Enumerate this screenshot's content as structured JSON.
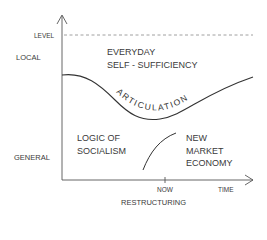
{
  "diagram": {
    "y_axis": {
      "labels": {
        "level": "LEVEL",
        "local": "LOCAL",
        "general": "GENERAL"
      }
    },
    "x_axis": {
      "ticks": {
        "now": "NOW",
        "time": "TIME"
      },
      "caption": "RESTRUCTURING"
    },
    "regions": {
      "top": [
        "EVERYDAY",
        "SELF - SUFFICIENCY"
      ],
      "bottom_left": [
        "LOGIC OF",
        "SOCIALISM"
      ],
      "bottom_right": [
        "NEW",
        "MARKET",
        "ECONOMY"
      ]
    },
    "curve_label": "ARTICULATION",
    "colors": {
      "ink": "#333333",
      "dashed": "#888888"
    }
  }
}
